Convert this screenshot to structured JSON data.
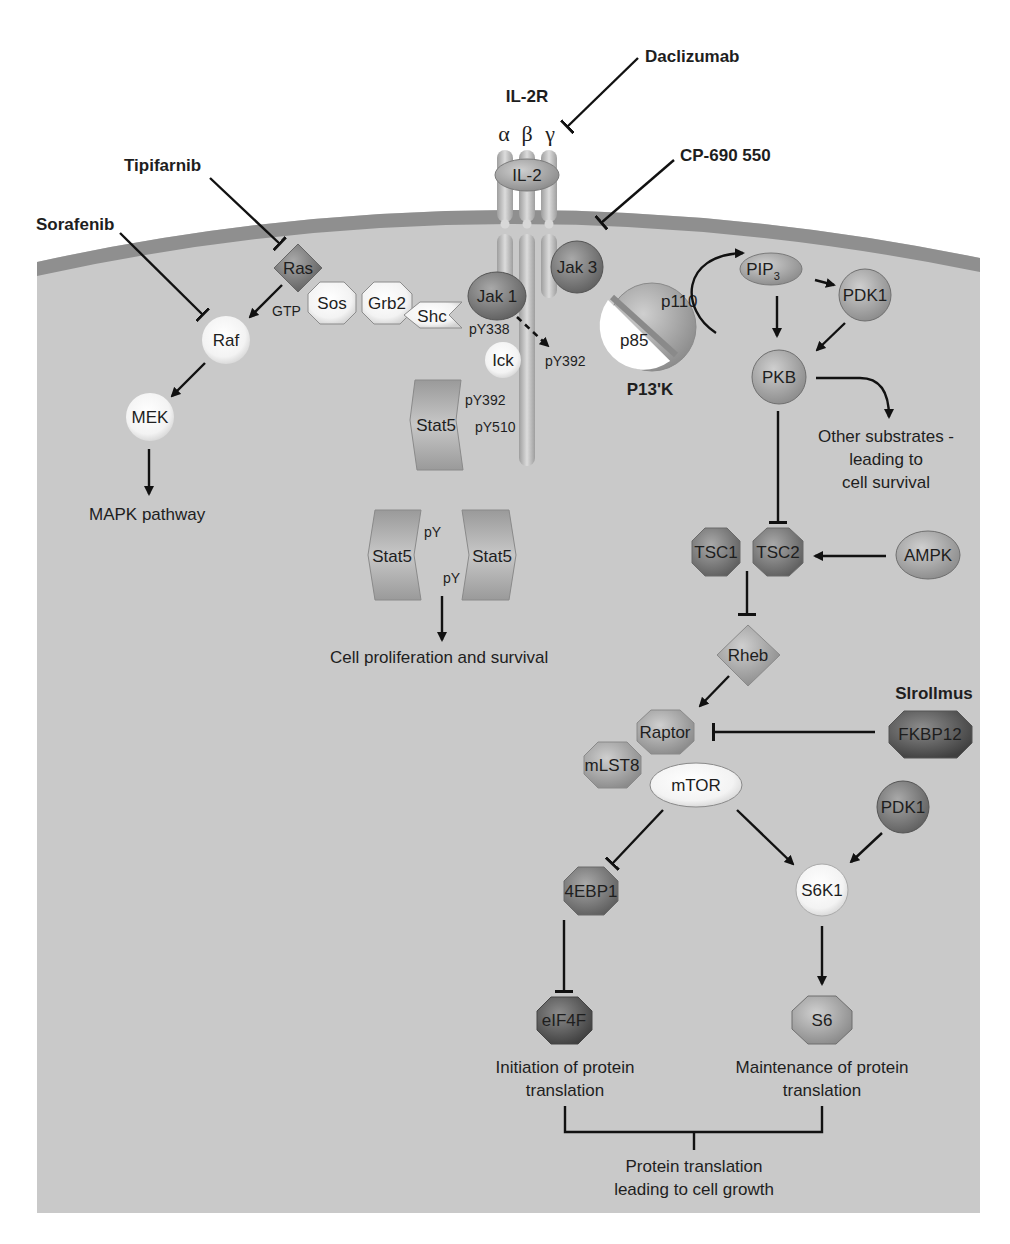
{
  "diagram": {
    "colors": {
      "background": "#ffffff",
      "cytoplasm": "#c9c9c9",
      "membrane": "#8f8f8f",
      "node_dark": "#7d7d7d",
      "node_mid": "#a5a5a5",
      "node_light": "#f2f2f2",
      "ink": "#111111"
    },
    "receptor": {
      "title": "IL-2R",
      "subunits": [
        "α",
        "β",
        "γ"
      ],
      "ligand": "IL-2"
    },
    "drugs": {
      "daclizumab": "Daclizumab",
      "cp690550": "CP-690 550",
      "tipifarnib": "Tipifarnib",
      "sorafenib": "Sorafenib",
      "sirolimus": "Slrollmus"
    },
    "nodes": {
      "ras": "Ras",
      "gtp": "GTP",
      "sos": "Sos",
      "grb2": "Grb2",
      "shc": "Shc",
      "jak1": "Jak 1",
      "jak3": "Jak 3",
      "lck": "Ick",
      "raf": "Raf",
      "mek": "MEK",
      "stat5_mono": "Stat5",
      "stat5_left": "Stat5",
      "stat5_right": "Stat5",
      "p110": "p110",
      "p85": "p85",
      "pi3k": "P13'K",
      "pip3_base": "PIP",
      "pip3_sub": "3",
      "pdk1_top": "PDK1",
      "pkb": "PKB",
      "tsc1": "TSC1",
      "tsc2": "TSC2",
      "ampk": "AMPK",
      "rheb": "Rheb",
      "raptor": "Raptor",
      "mlst8": "mLST8",
      "mtor": "mTOR",
      "fkbp12": "FKBP12",
      "pdk1_bottom": "PDK1",
      "s6k1": "S6K1",
      "ebp1": "4EBP1",
      "eif4f": "eIF4F",
      "s6": "S6"
    },
    "phospho_sites": {
      "py338": "pY338",
      "py392_jak": "pY392",
      "py392_stat": "pY392",
      "py510": "pY510",
      "py_top": "pY",
      "py_bottom": "pY"
    },
    "outcomes": {
      "mapk": "MAPK pathway",
      "proliferation": "Cell proliferation and survival",
      "other_substrates": [
        "Other substrates -",
        "leading to",
        "cell survival"
      ],
      "initiation": [
        "Initiation of protein",
        "translation"
      ],
      "maintenance": [
        "Maintenance of protein",
        "translation"
      ],
      "growth": [
        "Protein translation",
        "leading to cell growth"
      ]
    }
  }
}
